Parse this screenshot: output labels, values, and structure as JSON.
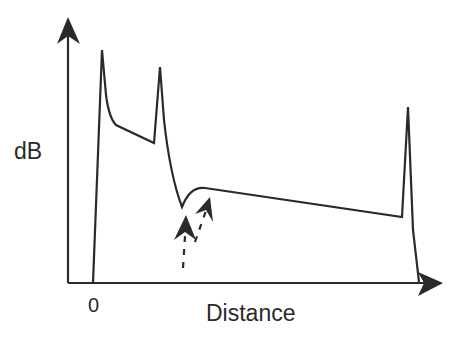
{
  "diagram": {
    "type": "OTDR trace schematic",
    "y_axis_label": "dB",
    "x_axis_label": "Distance",
    "origin_label": "0",
    "colors": {
      "line": "#2a2a2a",
      "background": "#ffffff"
    },
    "features": [
      {
        "name": "launch-reflection-peak",
        "x": 102,
        "y": 50
      },
      {
        "name": "connector-reflection-peak",
        "x": 160,
        "y": 67
      },
      {
        "name": "gainer-dip",
        "x": 182,
        "y": 208
      },
      {
        "name": "end-reflection-peak",
        "x": 408,
        "y": 107
      }
    ],
    "annotations": [
      {
        "name": "dashed-arrow-left",
        "points_to": "gainer-dip"
      },
      {
        "name": "dashed-arrow-right",
        "points_to": "gainer-dip"
      }
    ]
  }
}
